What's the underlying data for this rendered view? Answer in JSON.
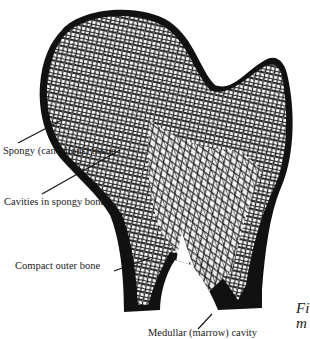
{
  "diagram": {
    "colors": {
      "ink": "#111111",
      "paper": "#ffffff"
    },
    "labels": [
      {
        "id": "spongy",
        "text": "Spongy (cancellous) tissue"
      },
      {
        "id": "cavities",
        "text": "Cavities in spongy bone"
      },
      {
        "id": "compact",
        "text": "Compact outer bone"
      },
      {
        "id": "medullar",
        "text": "Medullar (marrow) cavity"
      }
    ],
    "caption_fragment": {
      "line1": "Fi",
      "line2": "m"
    }
  }
}
